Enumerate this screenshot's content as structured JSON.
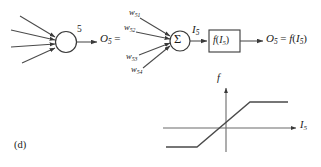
{
  "figure": {
    "panel_label": "(d)",
    "neuron": {
      "index_label": "5",
      "input_count": 4,
      "output_label_base": "O",
      "output_label_sub": "5",
      "output_label_eq": " ="
    },
    "weights": [
      {
        "name": "w-51",
        "base": "w",
        "sub": "51"
      },
      {
        "name": "w-52",
        "base": "w",
        "sub": "52"
      },
      {
        "name": "w-53",
        "base": "w",
        "sub": "53"
      },
      {
        "name": "w-54",
        "base": "w",
        "sub": "54"
      }
    ],
    "summation": {
      "symbol": "Σ",
      "output_base": "I",
      "output_sub": "5"
    },
    "activation_box": {
      "label_f": "f",
      "label_open": "(",
      "label_arg": "I",
      "label_arg_sub": "5",
      "label_close": ")"
    },
    "final_output": {
      "base": "O",
      "sub": "5",
      "eq": " = ",
      "fn": "f",
      "open": "(",
      "arg": "I",
      "arg_sub": "5",
      "close": ")"
    },
    "plot": {
      "y_axis_label": "f",
      "x_axis_label_base": "I",
      "x_axis_label_sub": "5",
      "curve_type": "saturating-linear",
      "stroke_color": "#3d3d3d"
    }
  }
}
